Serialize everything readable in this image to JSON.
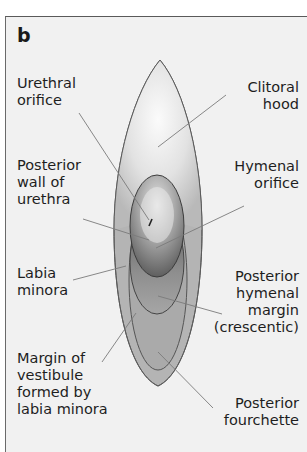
{
  "figure": {
    "panel_letter": "b",
    "colors": {
      "background": "#f1f1f1",
      "outline": "#5a5a5a",
      "leader_line": "#7a7a7a",
      "text": "#1e1e1e"
    }
  },
  "labels": {
    "urethral_orifice": "Urethral\norifice",
    "clitoral_hood": "Clitoral\nhood",
    "posterior_wall_of_urethra": "Posterior\nwall of\nurethra",
    "hymenal_orifice": "Hymenal\norifice",
    "labia_minora": "Labia\nminora",
    "posterior_hymenal_margin": "Posterior\nhymenal\nmargin\n(crescentic)",
    "margin_of_vestibule": "Margin of\nvestibule\nformed by\nlabia minora",
    "posterior_fourchette": "Posterior\nfourchette"
  }
}
